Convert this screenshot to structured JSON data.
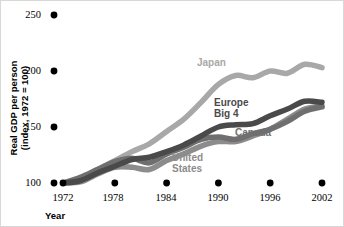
{
  "chart_data": {
    "type": "line",
    "title": "",
    "xlabel": "Year",
    "ylabel": "Real GDP per person (index, 1972 = 100)",
    "ylabel_line1": "Real GDP per person",
    "ylabel_line2": "(index, 1972 = 100)",
    "xlim": [
      1972,
      2002
    ],
    "ylim": [
      100,
      250
    ],
    "yticks": [
      100,
      150,
      200,
      250
    ],
    "xticks": [
      1972,
      1978,
      1984,
      1990,
      1996,
      2002
    ],
    "grid": false,
    "legend_position": "inline-labels",
    "x": [
      1972,
      1974,
      1976,
      1978,
      1980,
      1982,
      1984,
      1986,
      1988,
      1990,
      1992,
      1994,
      1996,
      1998,
      2000,
      2002
    ],
    "series": [
      {
        "name": "Japan",
        "color": "#a8a8a8",
        "label_x": 196,
        "label_y": 56,
        "values": [
          100,
          104,
          112,
          120,
          128,
          135,
          146,
          157,
          172,
          188,
          196,
          194,
          200,
          198,
          206,
          203
        ]
      },
      {
        "name": "Europe Big 4",
        "color": "#4a4a4a",
        "label_x": 213,
        "label_y": 96,
        "values": [
          100,
          102,
          109,
          115,
          121,
          123,
          128,
          134,
          142,
          150,
          152,
          153,
          160,
          166,
          173,
          172
        ]
      },
      {
        "name": "Canada",
        "color": "#6f6f6f",
        "label_x": 234,
        "label_y": 126,
        "values": [
          100,
          105,
          112,
          119,
          122,
          118,
          126,
          132,
          139,
          141,
          139,
          144,
          148,
          155,
          164,
          168
        ]
      },
      {
        "name": "United States",
        "color": "#8c8c8c",
        "label_x": 171,
        "label_y": 151,
        "label_line1": "United",
        "label_line2": "States",
        "values": [
          100,
          101,
          108,
          114,
          114,
          112,
          120,
          126,
          133,
          137,
          137,
          142,
          148,
          157,
          166,
          169
        ]
      }
    ]
  },
  "axis": {
    "y_tick_labels": [
      "250",
      "200",
      "150",
      "100"
    ],
    "x_tick_labels": [
      "1972",
      "1978",
      "1984",
      "1990",
      "1996",
      "2002"
    ]
  }
}
